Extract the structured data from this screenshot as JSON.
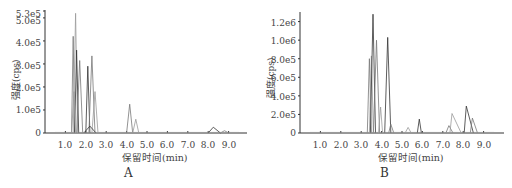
{
  "chart_data": [
    {
      "id": "A",
      "type": "line",
      "title": "",
      "panel_label": "A",
      "xlabel": "保留时间(min)",
      "ylabel": "强度(cps)",
      "xlim": [
        0,
        10
      ],
      "ylim": [
        0,
        530000
      ],
      "x_ticks": [
        "1.0",
        "2.0",
        "3.0",
        "4.0",
        "5.0",
        "6.0",
        "7.0",
        "8.0",
        "9.0"
      ],
      "y_ticks": [
        "0",
        "1.0e5",
        "2.0e5",
        "3.0e5",
        "4.0e5",
        "5.0e5",
        "5.3e5"
      ],
      "grid": false,
      "series": [
        {
          "name": "peak 1",
          "x": [
            1.3,
            1.38,
            1.45
          ],
          "values": [
            0,
            420000,
            0
          ]
        },
        {
          "name": "peak 2",
          "x": [
            1.38,
            1.5,
            1.6
          ],
          "values": [
            0,
            520000,
            0
          ]
        },
        {
          "name": "peak 3",
          "x": [
            1.45,
            1.55,
            1.65
          ],
          "values": [
            0,
            360000,
            0
          ]
        },
        {
          "name": "peak 4",
          "x": [
            1.55,
            1.7,
            1.85
          ],
          "values": [
            0,
            315000,
            0
          ]
        },
        {
          "name": "peak 5",
          "x": [
            1.3,
            1.42,
            1.5
          ],
          "values": [
            0,
            180000,
            0
          ]
        },
        {
          "name": "peak 6",
          "x": [
            2.0,
            2.1,
            2.2
          ],
          "values": [
            0,
            290000,
            0
          ]
        },
        {
          "name": "peak 7",
          "x": [
            2.15,
            2.3,
            2.45
          ],
          "values": [
            0,
            335000,
            0
          ]
        },
        {
          "name": "peak 8",
          "x": [
            2.3,
            2.45,
            2.6
          ],
          "values": [
            0,
            180000,
            0
          ]
        },
        {
          "name": "peak 9",
          "x": [
            1.9,
            2.2,
            2.5
          ],
          "values": [
            0,
            30000,
            0
          ]
        },
        {
          "name": "peak 10",
          "x": [
            4.0,
            4.15,
            4.3
          ],
          "values": [
            0,
            125000,
            0
          ]
        },
        {
          "name": "peak 11",
          "x": [
            4.3,
            4.45,
            4.6
          ],
          "values": [
            0,
            60000,
            0
          ]
        },
        {
          "name": "peak 12",
          "x": [
            8.0,
            8.25,
            8.6
          ],
          "values": [
            0,
            25000,
            0
          ]
        },
        {
          "name": "peak 13",
          "x": [
            8.6,
            8.8,
            9.0
          ],
          "values": [
            0,
            10000,
            0
          ]
        }
      ]
    },
    {
      "id": "B",
      "type": "line",
      "title": "",
      "panel_label": "B",
      "xlabel": "保留时间(min)",
      "ylabel": "强度(cps)",
      "xlim": [
        0,
        10
      ],
      "ylim": [
        0,
        1300000
      ],
      "x_ticks": [
        "1.0",
        "2.0",
        "3.0",
        "4.0",
        "5.0",
        "6.0",
        "7.0",
        "8.0",
        "9.0"
      ],
      "y_ticks": [
        "0",
        "2.0e5",
        "4.0e5",
        "6.0e5",
        "8.0e5",
        "1.0e6",
        "1.2e6"
      ],
      "grid": false,
      "series": [
        {
          "name": "peak 1",
          "x": [
            3.3,
            3.4,
            3.5
          ],
          "values": [
            0,
            800000,
            0
          ]
        },
        {
          "name": "peak 2",
          "x": [
            3.4,
            3.5,
            3.6
          ],
          "values": [
            0,
            830000,
            0
          ]
        },
        {
          "name": "peak 3",
          "x": [
            3.45,
            3.58,
            3.7
          ],
          "values": [
            0,
            1280000,
            0
          ]
        },
        {
          "name": "peak 4",
          "x": [
            3.6,
            3.75,
            3.9
          ],
          "values": [
            0,
            1000000,
            0
          ]
        },
        {
          "name": "peak 5",
          "x": [
            3.85,
            3.95,
            4.05
          ],
          "values": [
            0,
            280000,
            0
          ]
        },
        {
          "name": "peak 6",
          "x": [
            4.15,
            4.3,
            4.45
          ],
          "values": [
            0,
            1030000,
            0
          ]
        },
        {
          "name": "peak 7",
          "x": [
            4.35,
            4.45,
            4.6
          ],
          "values": [
            0,
            95000,
            0
          ]
        },
        {
          "name": "peak 8",
          "x": [
            5.15,
            5.3,
            5.45
          ],
          "values": [
            0,
            60000,
            0
          ]
        },
        {
          "name": "peak 9",
          "x": [
            5.75,
            5.85,
            5.95
          ],
          "values": [
            0,
            150000,
            0
          ]
        },
        {
          "name": "peak 10",
          "x": [
            7.15,
            7.3,
            7.5
          ],
          "values": [
            0,
            80000,
            0
          ]
        },
        {
          "name": "peak 11",
          "x": [
            7.35,
            7.45,
            7.9
          ],
          "values": [
            0,
            210000,
            0
          ]
        },
        {
          "name": "peak 12",
          "x": [
            8.05,
            8.15,
            8.5
          ],
          "values": [
            0,
            290000,
            0
          ]
        },
        {
          "name": "peak 13",
          "x": [
            8.35,
            8.45,
            8.7
          ],
          "values": [
            0,
            160000,
            0
          ]
        }
      ]
    }
  ],
  "panels": {
    "A": {
      "letter": "A",
      "xlabel": "保留时间(min)",
      "ylabel": "强度(cps)",
      "y_labels": [
        "5.3e5",
        "5.0e5",
        "4.0e5",
        "3.0e5",
        "2.0e5",
        "1.0e5",
        "0"
      ],
      "x_labels": [
        "1.0",
        "2.0",
        "3.0",
        "4.0",
        "5.0",
        "6.0",
        "7.0",
        "8.0",
        "9.0"
      ]
    },
    "B": {
      "letter": "B",
      "xlabel": "保留时间(min)",
      "ylabel": "强度(cps)",
      "y_labels": [
        "1.2e6",
        "1.0e6",
        "8.0e5",
        "6.0e5",
        "4.0e5",
        "2.0e5",
        "0"
      ],
      "x_labels": [
        "1.0",
        "2.0",
        "3.0",
        "4.0",
        "5.0",
        "6.0",
        "7.0",
        "8.0",
        "9.0"
      ]
    }
  },
  "colors": {
    "axis": "#333333",
    "trace_dark": "#333333",
    "trace_mid": "#777777",
    "trace_light": "#9a9a9a"
  }
}
